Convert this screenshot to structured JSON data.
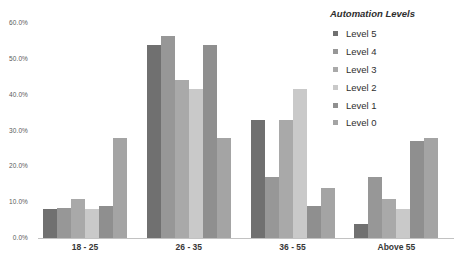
{
  "chart_data": {
    "type": "bar",
    "legend_title": "Automation Levels",
    "categories": [
      "18 - 25",
      "26 - 35",
      "36 - 55",
      "Above 55"
    ],
    "series": [
      {
        "name": "Level 5",
        "color": "#707070",
        "values": [
          8,
          54,
          33,
          4
        ]
      },
      {
        "name": "Level 4",
        "color": "#979797",
        "values": [
          8.5,
          56.5,
          17,
          17
        ]
      },
      {
        "name": "Level 3",
        "color": "#a9a9a9",
        "values": [
          11,
          44,
          33,
          11
        ]
      },
      {
        "name": "Level 2",
        "color": "#c9c9c9",
        "values": [
          8,
          41.5,
          41.5,
          8
        ]
      },
      {
        "name": "Level 1",
        "color": "#8f8f8f",
        "values": [
          9,
          54,
          9,
          27
        ]
      },
      {
        "name": "Level 0",
        "color": "#a4a4a4",
        "values": [
          28,
          28,
          14,
          28
        ]
      }
    ],
    "ylim": [
      0,
      60
    ],
    "y_tick_step": 10,
    "y_tick_labels": [
      "0.0%",
      "10.0%",
      "20.0%",
      "30.0%",
      "40.0%",
      "50.0%",
      "60.0%"
    ],
    "grid": false,
    "legend_position": "top-right"
  },
  "colors": {
    "axis_line": "#c2c2c2",
    "tick_text": "#5a5a5a",
    "category_text": "#373737",
    "legend_text": "#303030"
  }
}
